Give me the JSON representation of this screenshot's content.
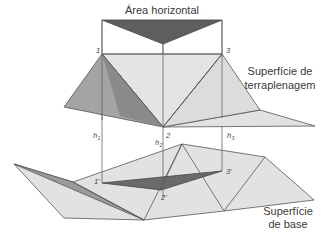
{
  "labels": {
    "horizontal_area": "Área horizontal",
    "fill_surface_line1": "Superfície de",
    "fill_surface_line2": "terraplenagem",
    "base_surface_line1": "Superfície",
    "base_surface_line2": "de base"
  },
  "points": {
    "p1": "1",
    "p2": "2",
    "p3": "3",
    "p1_base": "1'",
    "p2_base": "2'",
    "p3_base": "3'"
  },
  "heights": {
    "h1": {
      "base": "h",
      "sub": "1"
    },
    "h2": {
      "base": "h",
      "sub": "2"
    },
    "h3": {
      "base": "h",
      "sub": "3"
    }
  },
  "colors": {
    "dark_fill": "#6e6e6e",
    "medium_fill": "#9e9e9e",
    "light_fill": "#e0e0e0",
    "edge": "#555555",
    "text": "#3a3a3a"
  }
}
